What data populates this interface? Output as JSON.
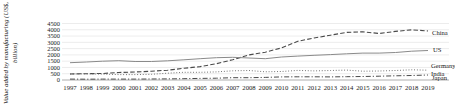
{
  "chart_data": {
    "type": "line",
    "title": "",
    "ylabel": "Value added by manufacturing (US$, billion)",
    "xlabel": "",
    "x": [
      1997,
      1998,
      1999,
      2000,
      2001,
      2002,
      2003,
      2004,
      2005,
      2006,
      2007,
      2008,
      2009,
      2010,
      2011,
      2012,
      2013,
      2014,
      2015,
      2016,
      2017,
      2018,
      2019
    ],
    "ylim": [
      0,
      4500
    ],
    "yticks": [
      0,
      500,
      1000,
      1500,
      2000,
      2500,
      3000,
      3500,
      4000,
      4500
    ],
    "grid": true,
    "legend_position": "right-end-labels",
    "series": [
      {
        "name": "China",
        "style": "dashed",
        "color": "#4a4a4a",
        "values": [
          480,
          500,
          520,
          600,
          640,
          700,
          780,
          930,
          1070,
          1300,
          1620,
          2000,
          2215,
          2560,
          3080,
          3345,
          3570,
          3790,
          3835,
          3700,
          3870,
          4000,
          3900
        ]
      },
      {
        "name": "US",
        "style": "solid",
        "color": "#8a8a8a",
        "values": [
          1380,
          1430,
          1500,
          1540,
          1470,
          1470,
          1530,
          1610,
          1700,
          1780,
          1810,
          1750,
          1700,
          1830,
          1900,
          1970,
          2020,
          2090,
          2140,
          2140,
          2190,
          2290,
          2350
        ]
      },
      {
        "name": "Germany",
        "style": "dotted",
        "color": "#666666",
        "values": [
          480,
          490,
          470,
          430,
          430,
          455,
          545,
          610,
          615,
          645,
          730,
          760,
          650,
          680,
          765,
          725,
          760,
          785,
          700,
          720,
          760,
          810,
          780
        ]
      },
      {
        "name": "India",
        "style": "dashdot",
        "color": "#4a4a4a",
        "values": [
          70,
          67,
          75,
          73,
          72,
          78,
          91,
          107,
          127,
          145,
          183,
          181,
          204,
          245,
          258,
          254,
          246,
          259,
          281,
          300,
          331,
          355,
          400
        ]
      }
    ],
    "annotations": [
      {
        "text": "Japan",
        "near": "India",
        "note_overlapping_label": true
      }
    ],
    "end_labels": [
      "China",
      "US",
      "Germany",
      "India",
      "Japan"
    ]
  },
  "colors": {
    "grid": "#dcdcdc",
    "baseline": "#9a9a9a",
    "text": "#1a1a1a"
  }
}
